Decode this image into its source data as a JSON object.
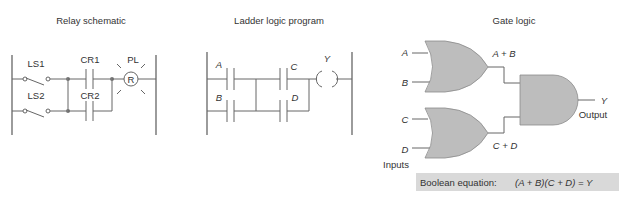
{
  "relay_schematic": {
    "title": "Relay schematic",
    "labels": {
      "ls1": "LS1",
      "ls2": "LS2",
      "cr1": "CR1",
      "cr2": "CR2",
      "pl": "PL",
      "lamp": "R"
    }
  },
  "ladder_logic": {
    "title": "Ladder logic program",
    "labels": {
      "a": "A",
      "b": "B",
      "c": "C",
      "d": "D",
      "y": "Y"
    }
  },
  "gate_logic": {
    "title": "Gate logic",
    "inputs": [
      "A",
      "B",
      "C",
      "D"
    ],
    "inputs_label": "Inputs",
    "or1_output": "A + B",
    "or2_output": "C + D",
    "output": "Y",
    "output_label": "Output",
    "equation_label": "Boolean equation:",
    "equation": "(A + B)(C + D) = Y",
    "equation_bg": "#d9d9d9",
    "gate_fill": "#bdbdbd"
  }
}
